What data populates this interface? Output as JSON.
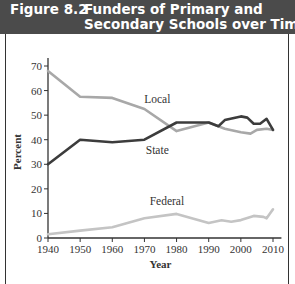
{
  "figure": {
    "number": "Figure 8.2",
    "title_line1": "Funders of Primary and",
    "title_line2": "Secondary Schools over Time",
    "title_bar_color": "#4b4b4b"
  },
  "chart_data": {
    "type": "line",
    "title": "Figure 8.2 Funders of Primary and Secondary Schools over Time",
    "xlabel": "Year",
    "ylabel": "Percent",
    "xlim": [
      1940,
      2012
    ],
    "ylim": [
      0,
      70
    ],
    "x_ticks": [
      1940,
      1950,
      1960,
      1970,
      1980,
      1990,
      2000,
      2010
    ],
    "y_ticks": [
      0,
      10,
      20,
      30,
      40,
      50,
      60,
      70
    ],
    "grid": false,
    "legend": "inline labels",
    "series": [
      {
        "name": "Local",
        "color": "#a8a8a8",
        "points": [
          [
            1940,
            68
          ],
          [
            1950,
            57.5
          ],
          [
            1960,
            57
          ],
          [
            1970,
            52.5
          ],
          [
            1980,
            43.5
          ],
          [
            1990,
            47
          ],
          [
            1995,
            44.5
          ],
          [
            2000,
            43
          ],
          [
            2003,
            42.5
          ],
          [
            2005,
            44
          ],
          [
            2008,
            44.5
          ],
          [
            2010,
            44
          ]
        ]
      },
      {
        "name": "State",
        "color": "#3c3c3c",
        "points": [
          [
            1940,
            30
          ],
          [
            1950,
            40
          ],
          [
            1960,
            39
          ],
          [
            1970,
            40
          ],
          [
            1980,
            47
          ],
          [
            1990,
            47
          ],
          [
            1993,
            45.5
          ],
          [
            1995,
            48
          ],
          [
            2000,
            49.5
          ],
          [
            2002,
            49
          ],
          [
            2004,
            46.5
          ],
          [
            2006,
            46.5
          ],
          [
            2008,
            48.5
          ],
          [
            2010,
            44
          ]
        ]
      },
      {
        "name": "Federal",
        "color": "#c4c4c4",
        "points": [
          [
            1940,
            1.5
          ],
          [
            1950,
            3
          ],
          [
            1960,
            4.4
          ],
          [
            1970,
            8
          ],
          [
            1980,
            9.8
          ],
          [
            1990,
            6.1
          ],
          [
            1994,
            7.2
          ],
          [
            1997,
            6.6
          ],
          [
            2000,
            7.3
          ],
          [
            2004,
            9
          ],
          [
            2007,
            8.6
          ],
          [
            2008,
            8
          ],
          [
            2010,
            11.7
          ]
        ]
      }
    ],
    "annotations": [
      {
        "text": "Local",
        "x": 1974,
        "y": 55
      },
      {
        "text": "State",
        "x": 1974,
        "y": 34
      },
      {
        "text": "Federal",
        "x": 1977,
        "y": 13.5
      }
    ]
  }
}
